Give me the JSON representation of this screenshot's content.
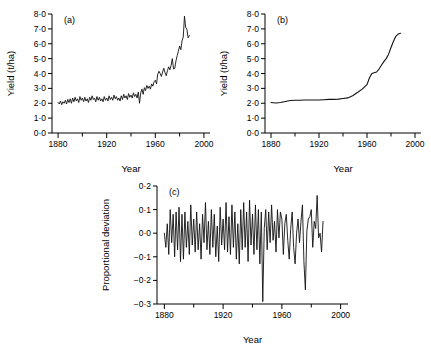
{
  "figure": {
    "background": "#ffffff",
    "line_color": "#111111"
  },
  "chart_data": [
    {
      "type": "line",
      "panel_label": "(a)",
      "title": "",
      "xlabel": "Year",
      "ylabel": "Yield (t/ha)",
      "xlim": [
        1875,
        2005
      ],
      "ylim": [
        0.0,
        8.0
      ],
      "grid": false,
      "legend": "none",
      "xticks": [
        1880,
        1920,
        1960,
        2000
      ],
      "xticklabels": [
        "1880",
        "1920",
        "1960",
        "2000"
      ],
      "xminorticks": [
        1900,
        1940,
        1980
      ],
      "yticks": [
        0.0,
        1.0,
        2.0,
        3.0,
        4.0,
        5.0,
        6.0,
        7.0,
        8.0
      ],
      "yticklabels": [
        "0·0",
        "1·0",
        "2·0",
        "3·0",
        "4·0",
        "5·0",
        "6·0",
        "7·0",
        "8·0"
      ],
      "x": [
        1880,
        1881,
        1882,
        1883,
        1884,
        1885,
        1886,
        1887,
        1888,
        1889,
        1890,
        1891,
        1892,
        1893,
        1894,
        1895,
        1896,
        1897,
        1898,
        1899,
        1900,
        1901,
        1902,
        1903,
        1904,
        1905,
        1906,
        1907,
        1908,
        1909,
        1910,
        1911,
        1912,
        1913,
        1914,
        1915,
        1916,
        1917,
        1918,
        1919,
        1920,
        1921,
        1922,
        1923,
        1924,
        1925,
        1926,
        1927,
        1928,
        1929,
        1930,
        1931,
        1932,
        1933,
        1934,
        1935,
        1936,
        1937,
        1938,
        1939,
        1940,
        1941,
        1942,
        1943,
        1944,
        1945,
        1946,
        1947,
        1948,
        1949,
        1950,
        1951,
        1952,
        1953,
        1954,
        1955,
        1956,
        1957,
        1958,
        1959,
        1960,
        1961,
        1962,
        1963,
        1964,
        1965,
        1966,
        1967,
        1968,
        1969,
        1970,
        1971,
        1972,
        1973,
        1974,
        1975,
        1976,
        1977,
        1978,
        1979,
        1980,
        1981,
        1982,
        1983,
        1984,
        1985,
        1986,
        1987,
        1988
      ],
      "values": [
        2.05,
        1.95,
        2.15,
        1.9,
        2.1,
        2.0,
        2.2,
        1.95,
        2.25,
        2.05,
        2.3,
        2.0,
        2.35,
        2.1,
        2.4,
        2.15,
        2.3,
        2.05,
        2.45,
        2.2,
        2.35,
        2.1,
        2.4,
        2.15,
        2.3,
        2.05,
        2.4,
        2.2,
        2.5,
        2.25,
        2.35,
        2.1,
        2.45,
        2.2,
        2.4,
        2.15,
        2.3,
        2.1,
        2.45,
        2.2,
        2.35,
        2.15,
        2.5,
        2.25,
        2.4,
        2.2,
        2.55,
        2.3,
        2.45,
        2.2,
        2.35,
        2.15,
        2.5,
        2.25,
        2.6,
        2.35,
        2.5,
        2.25,
        2.65,
        2.4,
        2.55,
        2.35,
        2.7,
        2.45,
        2.6,
        2.35,
        2.75,
        2.0,
        2.7,
        2.95,
        2.6,
        3.05,
        2.85,
        3.2,
        3.0,
        3.15,
        2.95,
        3.3,
        3.15,
        3.45,
        3.55,
        3.3,
        3.95,
        4.15,
        4.0,
        3.8,
        4.1,
        4.35,
        4.05,
        3.85,
        4.2,
        4.45,
        4.25,
        4.55,
        5.0,
        4.3,
        4.35,
        4.85,
        5.2,
        5.5,
        5.85,
        5.6,
        6.2,
        6.45,
        7.85,
        7.1,
        6.95,
        6.4,
        6.55
      ]
    },
    {
      "type": "line",
      "panel_label": "(b)",
      "title": "",
      "xlabel": "Year",
      "ylabel": "Yield (t/ha)",
      "xlim": [
        1875,
        2005
      ],
      "ylim": [
        0.0,
        8.0
      ],
      "grid": false,
      "legend": "none",
      "xticks": [
        1880,
        1920,
        1960,
        2000
      ],
      "xticklabels": [
        "1880",
        "1920",
        "1960",
        "2000"
      ],
      "xminorticks": [
        1900,
        1940,
        1980
      ],
      "yticks": [
        0.0,
        1.0,
        2.0,
        3.0,
        4.0,
        5.0,
        6.0,
        7.0,
        8.0
      ],
      "yticklabels": [
        "0·0",
        "1·0",
        "2·0",
        "3·0",
        "4·0",
        "5·0",
        "6·0",
        "7·0",
        "8·0"
      ],
      "series_note": "smoothed trend of panel (a)",
      "x": [
        1880,
        1884,
        1888,
        1892,
        1896,
        1900,
        1904,
        1908,
        1912,
        1916,
        1920,
        1924,
        1928,
        1932,
        1936,
        1940,
        1944,
        1948,
        1952,
        1956,
        1960,
        1962,
        1964,
        1966,
        1968,
        1970,
        1972,
        1974,
        1976,
        1978,
        1980,
        1982,
        1984,
        1986,
        1988
      ],
      "values": [
        2.05,
        2.02,
        2.05,
        2.12,
        2.18,
        2.2,
        2.2,
        2.22,
        2.22,
        2.22,
        2.22,
        2.24,
        2.26,
        2.26,
        2.28,
        2.32,
        2.36,
        2.5,
        2.72,
        2.95,
        3.25,
        3.7,
        4.0,
        4.05,
        4.1,
        4.3,
        4.55,
        4.8,
        5.0,
        5.3,
        5.75,
        6.15,
        6.5,
        6.65,
        6.7
      ]
    },
    {
      "type": "line",
      "panel_label": "(c)",
      "title": "",
      "xlabel": "Year",
      "ylabel": "Proportional deviation",
      "xlim": [
        1875,
        2005
      ],
      "ylim": [
        -0.3,
        0.2
      ],
      "grid": false,
      "legend": "none",
      "xticks": [
        1880,
        1920,
        1960,
        2000
      ],
      "xticklabels": [
        "1880",
        "1920",
        "1960",
        "2000"
      ],
      "xminorticks": [
        1900,
        1940,
        1980
      ],
      "yticks": [
        -0.3,
        -0.2,
        -0.1,
        0.0,
        0.1,
        0.2
      ],
      "yticklabels": [
        "−0·3",
        "−0·2",
        "−0·1",
        "0·0",
        "0·1",
        "0·2"
      ],
      "series_note": "residual of (a) relative to smoothed trend (b)",
      "x": [
        1880,
        1881,
        1882,
        1883,
        1884,
        1885,
        1886,
        1887,
        1888,
        1889,
        1890,
        1891,
        1892,
        1893,
        1894,
        1895,
        1896,
        1897,
        1898,
        1899,
        1900,
        1901,
        1902,
        1903,
        1904,
        1905,
        1906,
        1907,
        1908,
        1909,
        1910,
        1911,
        1912,
        1913,
        1914,
        1915,
        1916,
        1917,
        1918,
        1919,
        1920,
        1921,
        1922,
        1923,
        1924,
        1925,
        1926,
        1927,
        1928,
        1929,
        1930,
        1931,
        1932,
        1933,
        1934,
        1935,
        1936,
        1937,
        1938,
        1939,
        1940,
        1941,
        1942,
        1943,
        1944,
        1945,
        1946,
        1947,
        1948,
        1949,
        1950,
        1951,
        1952,
        1953,
        1954,
        1955,
        1956,
        1957,
        1958,
        1959,
        1960,
        1961,
        1962,
        1963,
        1964,
        1965,
        1966,
        1967,
        1968,
        1969,
        1970,
        1971,
        1972,
        1973,
        1974,
        1975,
        1976,
        1977,
        1978,
        1979,
        1980,
        1981,
        1982,
        1983,
        1984,
        1985,
        1986,
        1987,
        1988
      ],
      "values": [
        0.0,
        -0.06,
        0.04,
        -0.09,
        0.1,
        -0.04,
        0.08,
        -0.1,
        0.09,
        -0.07,
        0.11,
        -0.12,
        0.08,
        -0.11,
        0.09,
        -0.06,
        0.05,
        -0.09,
        0.12,
        -0.05,
        0.06,
        -0.08,
        0.09,
        -0.07,
        0.04,
        -0.11,
        0.08,
        -0.04,
        0.13,
        -0.07,
        0.05,
        -0.09,
        0.1,
        -0.06,
        0.08,
        -0.1,
        0.03,
        -0.12,
        0.11,
        -0.05,
        0.06,
        -0.07,
        0.13,
        -0.08,
        0.07,
        -0.09,
        0.12,
        -0.06,
        0.09,
        -0.11,
        0.04,
        -0.13,
        0.1,
        -0.07,
        0.13,
        -0.06,
        0.09,
        -0.12,
        0.14,
        -0.05,
        0.08,
        -0.09,
        0.12,
        -0.07,
        0.1,
        -0.13,
        0.09,
        -0.29,
        0.02,
        0.1,
        -0.07,
        0.09,
        -0.04,
        0.12,
        -0.03,
        0.05,
        -0.08,
        0.1,
        -0.02,
        0.09,
        0.06,
        -0.09,
        0.04,
        0.08,
        -0.03,
        -0.11,
        0.02,
        0.09,
        -0.06,
        -0.13,
        0.0,
        0.06,
        -0.04,
        0.05,
        0.12,
        -0.12,
        -0.24,
        0.01,
        0.06,
        0.07,
        0.1,
        -0.06,
        0.05,
        0.02,
        0.16,
        -0.02,
        0.0,
        -0.08,
        0.05
      ]
    }
  ]
}
